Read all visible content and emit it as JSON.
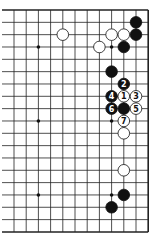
{
  "diagram": {
    "type": "go-board-fragment",
    "grid": {
      "cols": 12,
      "rows": 19,
      "x0": 14,
      "y0": 10,
      "dx": 12.2,
      "dy": 12.33,
      "right_edge": true,
      "top_edge": true,
      "bottom_edge": true
    },
    "star_points": [
      [
        2,
        3
      ],
      [
        8,
        3
      ],
      [
        2,
        9
      ],
      [
        8,
        9
      ],
      [
        2,
        15
      ],
      [
        8,
        15
      ]
    ],
    "stones": [
      {
        "c": 10,
        "r": 1,
        "color": "black",
        "label": ""
      },
      {
        "c": 10,
        "r": 2,
        "color": "black",
        "label": ""
      },
      {
        "c": 4,
        "r": 2,
        "color": "white",
        "label": ""
      },
      {
        "c": 8,
        "r": 2,
        "color": "white",
        "label": ""
      },
      {
        "c": 9,
        "r": 2,
        "color": "white",
        "label": ""
      },
      {
        "c": 7,
        "r": 3,
        "color": "white",
        "label": ""
      },
      {
        "c": 9,
        "r": 3,
        "color": "black",
        "label": ""
      },
      {
        "c": 8,
        "r": 5,
        "color": "black",
        "label": ""
      },
      {
        "c": 9,
        "r": 6,
        "color": "black",
        "label": "2"
      },
      {
        "c": 8,
        "r": 7,
        "color": "black",
        "label": "4"
      },
      {
        "c": 9,
        "r": 7,
        "color": "white",
        "label": "1"
      },
      {
        "c": 10,
        "r": 7,
        "color": "white",
        "label": "3"
      },
      {
        "c": 8,
        "r": 8,
        "color": "black",
        "label": "6"
      },
      {
        "c": 9,
        "r": 8,
        "color": "black",
        "label": ""
      },
      {
        "c": 10,
        "r": 8,
        "color": "white",
        "label": "5"
      },
      {
        "c": 9,
        "r": 9,
        "color": "white",
        "label": "7"
      },
      {
        "c": 9,
        "r": 10,
        "color": "white",
        "label": ""
      },
      {
        "c": 9,
        "r": 13,
        "color": "white",
        "label": ""
      },
      {
        "c": 9,
        "r": 15,
        "color": "black",
        "label": ""
      },
      {
        "c": 8,
        "r": 16,
        "color": "black",
        "label": ""
      }
    ]
  }
}
